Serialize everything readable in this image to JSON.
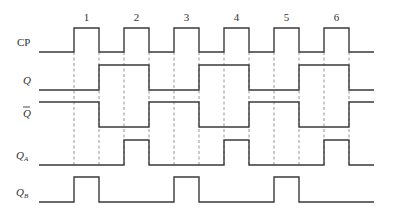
{
  "diagram": {
    "type": "timing-diagram",
    "colors": {
      "line": "#3a3a3a",
      "dash": "#8a8a8a",
      "text": "#333333",
      "background": "#ffffff"
    },
    "x_start": 39,
    "x_end": 374,
    "clock_numbers": [
      "1",
      "2",
      "3",
      "4",
      "5",
      "6"
    ],
    "signals": [
      {
        "name": "CP",
        "label": "CP",
        "subscript": "",
        "overline": false,
        "italic": false,
        "label_y": 46,
        "y_high": 28,
        "y_low": 52,
        "initial": 0,
        "high_intervals": [
          [
            74,
            99
          ],
          [
            124,
            149
          ],
          [
            174,
            199
          ],
          [
            224,
            249
          ],
          [
            274,
            299
          ],
          [
            324,
            349
          ]
        ]
      },
      {
        "name": "Q",
        "label": "Q",
        "subscript": "",
        "overline": false,
        "italic": true,
        "label_y": 84,
        "y_high": 65,
        "y_low": 90,
        "initial": 0,
        "high_intervals": [
          [
            99,
            149
          ],
          [
            199,
            249
          ],
          [
            299,
            349
          ]
        ]
      },
      {
        "name": "Q-bar",
        "label": "Q",
        "subscript": "",
        "overline": true,
        "italic": true,
        "label_y": 117,
        "y_high": 102,
        "y_low": 127,
        "initial": 1,
        "high_intervals": [
          [
            39,
            99
          ],
          [
            149,
            199
          ],
          [
            249,
            299
          ],
          [
            349,
            374
          ]
        ]
      },
      {
        "name": "QA",
        "label": "Q",
        "subscript": "A",
        "overline": false,
        "italic": true,
        "label_y": 159,
        "y_high": 140,
        "y_low": 165,
        "initial": 0,
        "high_intervals": [
          [
            124,
            149
          ],
          [
            224,
            249
          ],
          [
            324,
            349
          ]
        ]
      },
      {
        "name": "QB",
        "label": "Q",
        "subscript": "B",
        "overline": false,
        "italic": true,
        "label_y": 196,
        "y_high": 177,
        "y_low": 202,
        "initial": 0,
        "high_intervals": [
          [
            74,
            99
          ],
          [
            174,
            199
          ],
          [
            274,
            299
          ]
        ]
      }
    ],
    "dashed_guides": {
      "x": [
        74,
        99,
        124,
        149,
        174,
        199,
        224,
        249,
        274,
        299,
        324,
        349
      ],
      "y_top": 52,
      "y_bottom": 165
    }
  }
}
